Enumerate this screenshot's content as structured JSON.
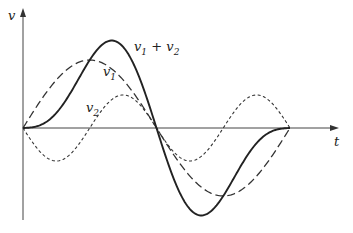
{
  "diagram": {
    "type": "waveform-superposition",
    "axes": {
      "y_label": "v",
      "x_label": "t"
    },
    "curves": [
      {
        "id": "v1",
        "label_main": "v",
        "label_sub": "1",
        "style": "long-dash",
        "description": "fundamental sine, one full period"
      },
      {
        "id": "v2",
        "label_main": "v",
        "label_sub": "2",
        "style": "short-dash",
        "description": "second harmonic, negative-going start"
      },
      {
        "id": "sum",
        "label_main": "v",
        "label_sub1": "1",
        "plus": " + ",
        "label_main2": "v",
        "label_sub2": "2",
        "style": "solid",
        "description": "sum v1 + v2"
      }
    ],
    "colors": {
      "stroke": "#222222",
      "background": "#ffffff"
    }
  }
}
